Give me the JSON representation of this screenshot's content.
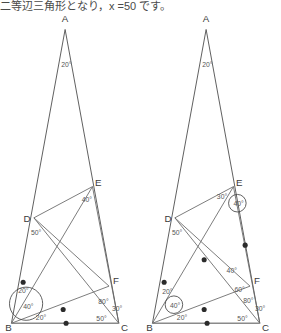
{
  "page": {
    "top_text": "二等辺三角形となり，x =50 です。",
    "background": "#ffffff",
    "ink": "#5c5c5c"
  },
  "figures": [
    {
      "id": "left-figure",
      "name": "triangle-diagram-left",
      "vertices": [
        {
          "name": "A",
          "label": "A",
          "x": 65,
          "y": 14
        },
        {
          "name": "B",
          "label": "B",
          "x": 7,
          "y": 328
        },
        {
          "name": "C",
          "label": "C",
          "x": 122,
          "y": 328
        },
        {
          "name": "D",
          "label": "D",
          "x": 26,
          "y": 216
        },
        {
          "name": "E",
          "label": "E",
          "x": 96,
          "y": 182
        },
        {
          "name": "F",
          "label": "F",
          "x": 113,
          "y": 283
        }
      ],
      "angles": [
        {
          "label": "20°",
          "at": "A",
          "x": 61,
          "y": 60,
          "circled": false
        },
        {
          "label": "40°",
          "at": "E",
          "x": 82,
          "y": 199,
          "circled": false
        },
        {
          "label": "50°",
          "at": "D",
          "x": 30,
          "y": 233,
          "circled": false
        },
        {
          "label": "80°",
          "at": "F",
          "x": 99,
          "y": 303,
          "circled": false
        },
        {
          "label": "30°",
          "at": "C",
          "x": 113,
          "y": 310,
          "circled": false
        },
        {
          "label": "50°",
          "at": "C",
          "x": 97,
          "y": 321,
          "circled": false
        },
        {
          "label": "20°",
          "at": "B",
          "x": 35,
          "y": 320,
          "circled": false
        },
        {
          "label": "20°",
          "at": "B",
          "x": 17,
          "y": 292,
          "circled": true
        },
        {
          "label": "40°",
          "at": "B",
          "x": 22,
          "y": 308,
          "circled": true
        }
      ],
      "ticks": [
        {
          "on": "BD",
          "x": 18,
          "y": 275
        },
        {
          "on": "BF",
          "x": 58,
          "y": 305
        },
        {
          "on": "BC",
          "x": 62,
          "y": 323
        }
      ]
    },
    {
      "id": "right-figure",
      "name": "triangle-diagram-right",
      "vertices": [
        {
          "name": "A",
          "label": "A",
          "x": 65,
          "y": 14
        },
        {
          "name": "B",
          "label": "B",
          "x": 7,
          "y": 328
        },
        {
          "name": "C",
          "label": "C",
          "x": 122,
          "y": 328
        },
        {
          "name": "D",
          "label": "D",
          "x": 26,
          "y": 216
        },
        {
          "name": "E",
          "label": "E",
          "x": 96,
          "y": 182
        },
        {
          "name": "F",
          "label": "F",
          "x": 113,
          "y": 283
        }
      ],
      "angles": [
        {
          "label": "20°",
          "at": "A",
          "x": 61,
          "y": 60,
          "circled": false
        },
        {
          "label": "30°",
          "at": "E",
          "x": 76,
          "y": 196,
          "circled": false
        },
        {
          "label": "40°",
          "at": "E",
          "x": 93,
          "y": 203,
          "circled": true
        },
        {
          "label": "50°",
          "at": "D",
          "x": 30,
          "y": 233,
          "circled": false
        },
        {
          "label": "40°",
          "at": "F",
          "x": 86,
          "y": 272,
          "circled": false
        },
        {
          "label": "60°",
          "at": "F",
          "x": 94,
          "y": 291,
          "circled": false
        },
        {
          "label": "80°",
          "at": "F",
          "x": 103,
          "y": 302,
          "circled": false
        },
        {
          "label": "30°",
          "at": "C",
          "x": 115,
          "y": 310,
          "circled": false
        },
        {
          "label": "50°",
          "at": "C",
          "x": 97,
          "y": 321,
          "circled": false
        },
        {
          "label": "20°",
          "at": "B",
          "x": 35,
          "y": 320,
          "circled": false
        },
        {
          "label": "20°",
          "at": "D",
          "x": 20,
          "y": 293,
          "circled": false
        },
        {
          "label": "40°",
          "at": "B",
          "x": 28,
          "y": 307,
          "circled": true
        }
      ],
      "ticks": [
        {
          "on": "BD",
          "x": 18,
          "y": 275
        },
        {
          "on": "AC-upper",
          "x": 101,
          "y": 243
        },
        {
          "on": "BE",
          "x": 60,
          "y": 270
        },
        {
          "on": "BF",
          "x": 58,
          "y": 305
        },
        {
          "on": "BC",
          "x": 62,
          "y": 323
        }
      ]
    }
  ]
}
